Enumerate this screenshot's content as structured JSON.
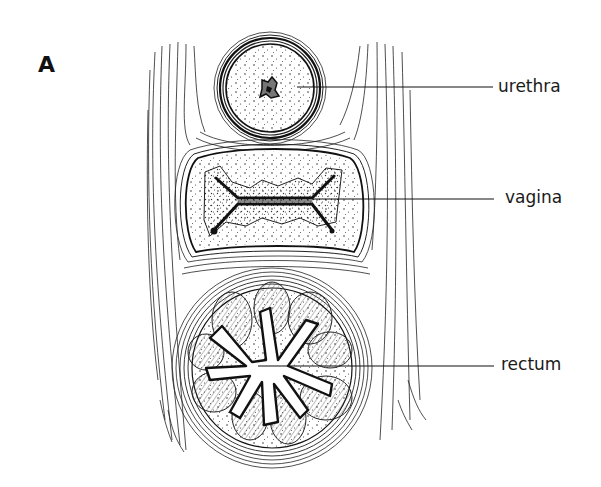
{
  "figure": {
    "panel_label": "A",
    "labels": [
      {
        "id": "urethra",
        "text": "urethra"
      },
      {
        "id": "vagina",
        "text": "vagina"
      },
      {
        "id": "rectum",
        "text": "rectum"
      }
    ]
  },
  "colors": {
    "ink": "#1a1a1a",
    "background": "#ffffff"
  }
}
